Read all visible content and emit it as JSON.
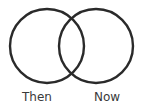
{
  "diagram": {
    "type": "venn",
    "sets": [
      {
        "label": "Then",
        "stroke_color": "#2a2a2a"
      },
      {
        "label": "Now",
        "stroke_color": "#2a2a2a"
      }
    ],
    "text_color": "#3a3a3a"
  }
}
